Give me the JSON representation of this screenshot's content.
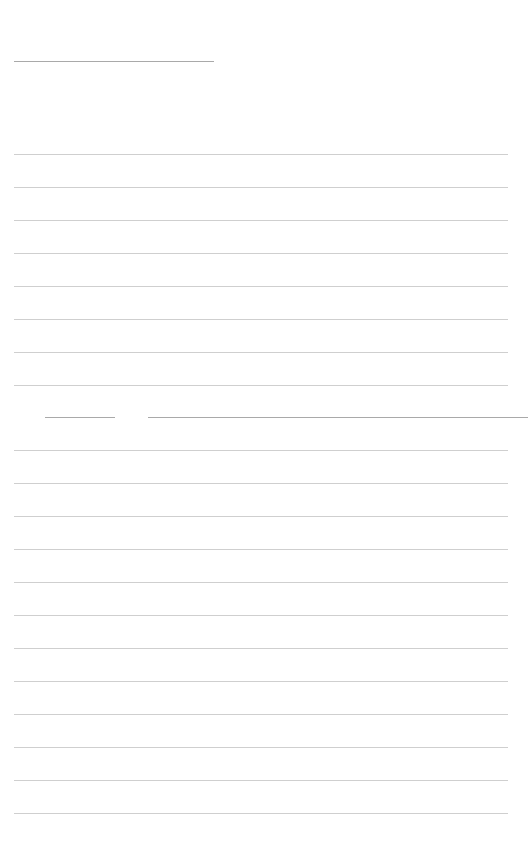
{
  "page": {
    "background": "#ffffff",
    "line_color": "#cfcfcf",
    "header_line": {
      "x": 14,
      "y": 61,
      "width": 200
    },
    "ruled_lines_top": {
      "x": 14,
      "width": 494,
      "start_y": 154,
      "spacing": 33,
      "count": 8
    },
    "split_line_segments": [
      {
        "x": 45,
        "y": 417,
        "width": 70
      },
      {
        "x": 148,
        "y": 417,
        "width": 380
      }
    ],
    "ruled_lines_bottom": {
      "x": 14,
      "width": 494,
      "start_y": 450,
      "spacing": 33,
      "count": 12
    }
  }
}
